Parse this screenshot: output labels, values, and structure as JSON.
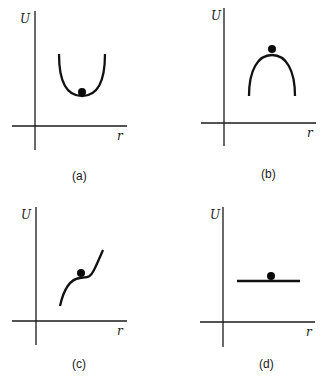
{
  "figure": {
    "axis_labels": {
      "y": "U",
      "x": "r"
    },
    "panels": [
      {
        "id": "a",
        "caption": "(a)",
        "curve_shape": "U-shaped well (minimum)",
        "equilibrium": "stable"
      },
      {
        "id": "b",
        "caption": "(b)",
        "curve_shape": "inverted U (maximum)",
        "equilibrium": "unstable"
      },
      {
        "id": "c",
        "caption": "(c)",
        "curve_shape": "rising curve with inflection plateau",
        "equilibrium": "semi-stable"
      },
      {
        "id": "d",
        "caption": "(d)",
        "curve_shape": "horizontal flat line",
        "equilibrium": "neutral"
      }
    ],
    "colors": {
      "ink": "#111111",
      "background": "#ffffff"
    }
  }
}
